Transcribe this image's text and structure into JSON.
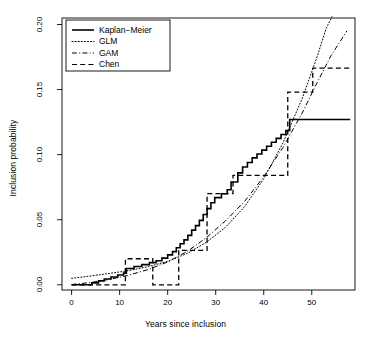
{
  "chart_data": {
    "type": "line",
    "title": "",
    "xlabel": "Years since inclusion",
    "ylabel": "Inclusion probability",
    "xlim": [
      -2.0,
      59.0
    ],
    "ylim": [
      -0.004,
      0.205
    ],
    "xticks": [
      0,
      10,
      20,
      30,
      40,
      50
    ],
    "xtick_labels": [
      "0",
      "10",
      "20",
      "30",
      "40",
      "50"
    ],
    "yticks": [
      0.0,
      0.05,
      0.1,
      0.15,
      0.2
    ],
    "ytick_labels": [
      "0.00",
      "0.05",
      "0.10",
      "0.15",
      "0.20"
    ],
    "grid": false,
    "legend_position": "top-left",
    "series": [
      {
        "name": "Kaplan-Meier",
        "style": "solid",
        "color": "#000000",
        "line_width": 1.6,
        "draw": "step",
        "points": [
          [
            0.0,
            0.0
          ],
          [
            4.2,
            0.0
          ],
          [
            4.2,
            0.0015
          ],
          [
            5.6,
            0.0015
          ],
          [
            5.6,
            0.003
          ],
          [
            6.8,
            0.003
          ],
          [
            6.8,
            0.0045
          ],
          [
            8.2,
            0.0045
          ],
          [
            8.2,
            0.006
          ],
          [
            9.6,
            0.006
          ],
          [
            9.6,
            0.0075
          ],
          [
            10.8,
            0.0075
          ],
          [
            10.8,
            0.009
          ],
          [
            11.4,
            0.009
          ],
          [
            11.4,
            0.0125
          ],
          [
            13.0,
            0.0125
          ],
          [
            13.0,
            0.014
          ],
          [
            14.6,
            0.014
          ],
          [
            14.6,
            0.0155
          ],
          [
            16.2,
            0.0155
          ],
          [
            16.2,
            0.017
          ],
          [
            17.6,
            0.017
          ],
          [
            17.6,
            0.0185
          ],
          [
            18.8,
            0.0185
          ],
          [
            18.8,
            0.0205
          ],
          [
            20.0,
            0.0205
          ],
          [
            20.0,
            0.023
          ],
          [
            21.0,
            0.023
          ],
          [
            21.0,
            0.0255
          ],
          [
            21.8,
            0.0255
          ],
          [
            21.8,
            0.0285
          ],
          [
            22.6,
            0.0285
          ],
          [
            22.6,
            0.0315
          ],
          [
            23.4,
            0.0315
          ],
          [
            23.4,
            0.0345
          ],
          [
            24.2,
            0.0345
          ],
          [
            24.2,
            0.038
          ],
          [
            25.0,
            0.038
          ],
          [
            25.0,
            0.042
          ],
          [
            25.8,
            0.042
          ],
          [
            25.8,
            0.0455
          ],
          [
            26.6,
            0.0455
          ],
          [
            26.6,
            0.0495
          ],
          [
            27.4,
            0.0495
          ],
          [
            27.4,
            0.054
          ],
          [
            28.2,
            0.054
          ],
          [
            28.2,
            0.0585
          ],
          [
            29.0,
            0.0585
          ],
          [
            29.0,
            0.063
          ],
          [
            29.8,
            0.063
          ],
          [
            29.8,
            0.067
          ],
          [
            31.2,
            0.067
          ],
          [
            31.2,
            0.07
          ],
          [
            32.4,
            0.07
          ],
          [
            32.4,
            0.073
          ],
          [
            33.2,
            0.073
          ],
          [
            33.2,
            0.079
          ],
          [
            34.6,
            0.079
          ],
          [
            34.6,
            0.086
          ],
          [
            35.6,
            0.086
          ],
          [
            35.6,
            0.0905
          ],
          [
            36.6,
            0.0905
          ],
          [
            36.6,
            0.094
          ],
          [
            37.6,
            0.094
          ],
          [
            37.6,
            0.0975
          ],
          [
            38.6,
            0.0975
          ],
          [
            38.6,
            0.1005
          ],
          [
            39.6,
            0.1005
          ],
          [
            39.6,
            0.1035
          ],
          [
            40.6,
            0.1035
          ],
          [
            40.6,
            0.1065
          ],
          [
            41.6,
            0.1065
          ],
          [
            41.6,
            0.1095
          ],
          [
            42.6,
            0.1095
          ],
          [
            42.6,
            0.1125
          ],
          [
            43.6,
            0.1125
          ],
          [
            43.6,
            0.1155
          ],
          [
            44.6,
            0.1155
          ],
          [
            44.6,
            0.1185
          ],
          [
            45.4,
            0.1185
          ],
          [
            45.4,
            0.127
          ],
          [
            58.0,
            0.127
          ]
        ]
      },
      {
        "name": "GLM",
        "style": "dotted",
        "color": "#000000",
        "line_width": 1.0,
        "draw": "smooth",
        "points": [
          [
            0.0,
            0.005
          ],
          [
            4.0,
            0.0068
          ],
          [
            8.0,
            0.0088
          ],
          [
            12.0,
            0.011
          ],
          [
            16.0,
            0.014
          ],
          [
            20.0,
            0.018
          ],
          [
            24.0,
            0.024
          ],
          [
            28.0,
            0.0325
          ],
          [
            32.0,
            0.044
          ],
          [
            36.0,
            0.06
          ],
          [
            40.0,
            0.0815
          ],
          [
            44.0,
            0.109
          ],
          [
            48.0,
            0.143
          ],
          [
            51.0,
            0.174
          ],
          [
            53.0,
            0.197
          ],
          [
            54.2,
            0.206
          ]
        ]
      },
      {
        "name": "GAM",
        "style": "dashdot",
        "color": "#000000",
        "line_width": 1.0,
        "draw": "smooth",
        "points": [
          [
            0.0,
            0.0002
          ],
          [
            4.0,
            0.0018
          ],
          [
            8.0,
            0.0042
          ],
          [
            12.0,
            0.0075
          ],
          [
            16.0,
            0.0118
          ],
          [
            20.0,
            0.0175
          ],
          [
            24.0,
            0.0255
          ],
          [
            28.0,
            0.036
          ],
          [
            32.0,
            0.049
          ],
          [
            36.0,
            0.064
          ],
          [
            40.0,
            0.083
          ],
          [
            44.0,
            0.1055
          ],
          [
            48.0,
            0.132
          ],
          [
            51.0,
            0.1545
          ],
          [
            54.0,
            0.176
          ],
          [
            57.3,
            0.195
          ]
        ]
      },
      {
        "name": "Chen",
        "style": "dashed",
        "color": "#000000",
        "line_width": 1.3,
        "draw": "step",
        "points": [
          [
            0.0,
            0.0
          ],
          [
            11.2,
            0.0
          ],
          [
            11.2,
            0.02
          ],
          [
            16.9,
            0.02
          ],
          [
            16.9,
            0.0
          ],
          [
            22.3,
            0.0
          ],
          [
            22.3,
            0.0265
          ],
          [
            28.2,
            0.0265
          ],
          [
            28.2,
            0.07
          ],
          [
            33.6,
            0.07
          ],
          [
            33.6,
            0.084
          ],
          [
            45.0,
            0.084
          ],
          [
            45.0,
            0.148
          ],
          [
            50.2,
            0.148
          ],
          [
            50.2,
            0.1665
          ],
          [
            58.0,
            0.1665
          ]
        ]
      }
    ]
  },
  "legend": {
    "entries": [
      {
        "label": "Kaplan−Meier",
        "style": "solid"
      },
      {
        "label": "GLM",
        "style": "dotted"
      },
      {
        "label": "GAM",
        "style": "dashdot"
      },
      {
        "label": "Chen",
        "style": "dashed"
      }
    ]
  }
}
